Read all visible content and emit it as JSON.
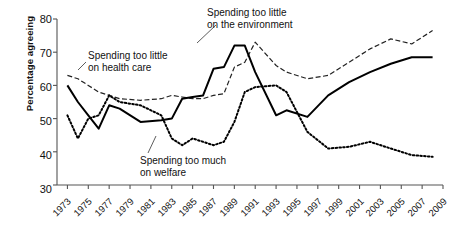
{
  "chart_data": {
    "type": "line",
    "title": "",
    "xlabel": "",
    "ylabel": "Percentage agreeing",
    "ylim": [
      30,
      80
    ],
    "xlim": [
      1972,
      2009
    ],
    "yticks": [
      30,
      40,
      50,
      60,
      70,
      80
    ],
    "grid": false,
    "legend_position": "inline-annotations",
    "xticks": [
      1973,
      1975,
      1977,
      1979,
      1981,
      1983,
      1985,
      1987,
      1989,
      1991,
      1993,
      1995,
      1997,
      1999,
      2001,
      2003,
      2005,
      2007,
      2009
    ],
    "xtick_labels": [
      "1973",
      "1975",
      "1977",
      "1979",
      "1981",
      "1983",
      "1985",
      "1987",
      "1989",
      "1991",
      "1993",
      "1995",
      "1997",
      "1999",
      "2001",
      "2003",
      "2005",
      "2007",
      "2009"
    ],
    "series": [
      {
        "name": "Spending too little on health care",
        "style": "dashed",
        "color": "#222222",
        "x": [
          1973,
          1974,
          1975,
          1976,
          1977,
          1978,
          1980,
          1982,
          1983,
          1984,
          1985,
          1986,
          1987,
          1988,
          1989,
          1990,
          1991,
          1993,
          1994,
          1996,
          1998,
          2000,
          2002,
          2004,
          2006,
          2008
        ],
        "y": [
          63,
          62,
          60,
          58,
          57,
          56,
          55.5,
          56,
          57,
          56.5,
          56,
          56,
          57,
          57.5,
          65.5,
          67,
          73,
          66,
          64,
          62,
          63,
          67,
          71,
          74,
          72.5,
          76.5
        ]
      },
      {
        "name": "Spending too little on the environment",
        "style": "solid",
        "color": "#000000",
        "x": [
          1973,
          1974,
          1975,
          1976,
          1977,
          1978,
          1980,
          1982,
          1983,
          1984,
          1985,
          1986,
          1987,
          1988,
          1989,
          1990,
          1991,
          1993,
          1994,
          1996,
          1998,
          2000,
          2002,
          2004,
          2006,
          2008
        ],
        "y": [
          60,
          55,
          51,
          47,
          54,
          53,
          49,
          49.5,
          50,
          56,
          56.5,
          57,
          65,
          65.5,
          72,
          72,
          64,
          51,
          52.5,
          50.5,
          57,
          61,
          64,
          66.5,
          68.5,
          68.5
        ]
      },
      {
        "name": "Spending too much on welfare",
        "style": "dotted",
        "color": "#000000",
        "x": [
          1973,
          1974,
          1975,
          1976,
          1977,
          1978,
          1980,
          1982,
          1983,
          1984,
          1985,
          1986,
          1987,
          1988,
          1989,
          1990,
          1991,
          1993,
          1994,
          1996,
          1998,
          2000,
          2002,
          2004,
          2006,
          2008
        ],
        "y": [
          51,
          44,
          50,
          51,
          57,
          55,
          54,
          51,
          44,
          42,
          44,
          43,
          42,
          43,
          49,
          58,
          59.5,
          60,
          58,
          46,
          41,
          41.5,
          43,
          41,
          39,
          38.5
        ]
      }
    ],
    "annotations": [
      {
        "id": "health",
        "line1": "Spending too little",
        "line2": "on health care"
      },
      {
        "id": "environment",
        "line1": "Spending too little",
        "line2": "on the environment"
      },
      {
        "id": "welfare",
        "line1": "Spending too much",
        "line2": "on welfare"
      }
    ],
    "axis_color": "#555555"
  }
}
